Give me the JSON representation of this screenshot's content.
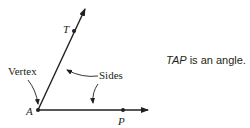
{
  "diagram": {
    "labels": {
      "vertex_point": "A",
      "point_on_upper_ray": "T",
      "point_on_lower_ray": "P",
      "vertex_callout": "Vertex",
      "sides_callout": "Sides"
    },
    "caption": {
      "angle_name": "TAP",
      "text": " is an angle."
    },
    "colors": {
      "ink": "#231f20",
      "background": "#ffffff"
    }
  }
}
